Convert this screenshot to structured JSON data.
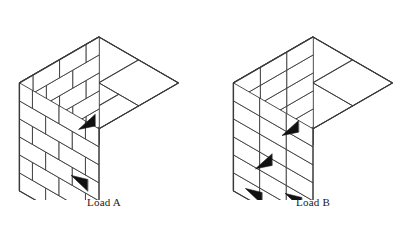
{
  "figure": {
    "type": "isometric-line-diagram",
    "background_color": "#ffffff",
    "stroke_color": "#3a3a3a",
    "marker_color": "#111111",
    "face_fill": "#ffffff",
    "width": 417,
    "height": 228
  },
  "loads": [
    {
      "id": "load-a",
      "caption": "Load A",
      "pattern": "interlocked-staggered",
      "courses": 6,
      "bricks_per_course_left": 3,
      "bricks_per_course_right": 3,
      "top_layer_pattern": "pinwheel-staggered",
      "markers": [
        {
          "name": "slip-marker-left",
          "face": "left",
          "direction": "right",
          "course_from_bottom": 2
        },
        {
          "name": "slip-marker-right",
          "face": "right",
          "direction": "left",
          "course_from_bottom": 3
        }
      ],
      "marker_count": 2,
      "origin": {
        "x": 18,
        "y": 40
      },
      "size": {
        "width": 162,
        "height": 150
      }
    },
    {
      "id": "load-b",
      "caption": "Load B",
      "pattern": "column-stacked-aligned",
      "courses": 6,
      "bricks_per_course_left": 3,
      "bricks_per_course_right": 3,
      "top_layer_pattern": "aligned-grid",
      "markers": [
        {
          "name": "slip-marker-left-upper",
          "face": "left",
          "direction": "right",
          "course_from_bottom": 2
        },
        {
          "name": "slip-marker-left-lower",
          "face": "left",
          "direction": "right",
          "course_from_bottom": 1
        },
        {
          "name": "slip-marker-right-lower",
          "face": "right",
          "direction": "left",
          "course_from_bottom": 1
        },
        {
          "name": "slip-marker-right-upper",
          "face": "right",
          "direction": "left",
          "course_from_bottom": 2
        }
      ],
      "marker_count": 4,
      "origin": {
        "x": 232,
        "y": 40
      },
      "size": {
        "width": 162,
        "height": 150
      }
    }
  ]
}
